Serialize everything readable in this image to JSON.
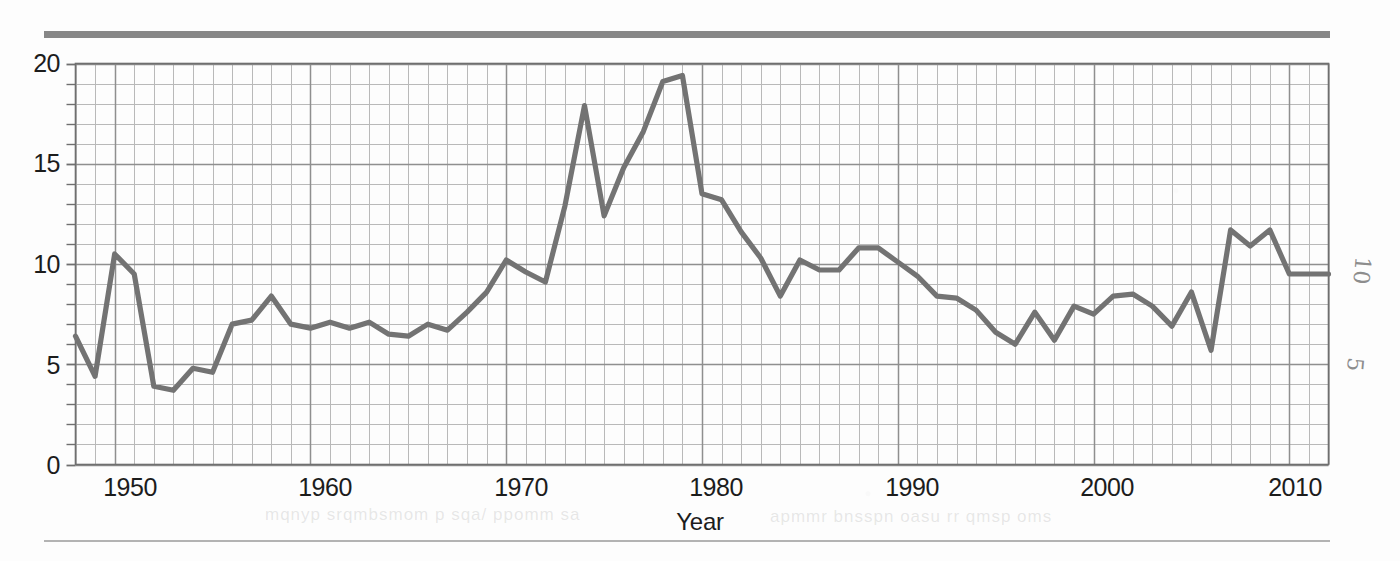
{
  "figure": {
    "axis_x_title": "Year",
    "y_ticks": [
      "0",
      "5",
      "10",
      "15",
      "20"
    ],
    "x_ticks": [
      "1950",
      "1960",
      "1970",
      "1980",
      "1990",
      "2000",
      "2010"
    ],
    "line_color": "#737373",
    "grid_color": "#8f8f8f",
    "grid_minor_color": "#b9b9b9",
    "rule_color": "#878787"
  },
  "annotations": {
    "hand_10": "10",
    "hand_5": "5"
  },
  "chart_data": {
    "type": "line",
    "title": "",
    "subtitle": "",
    "xlabel": "Year",
    "ylabel": "",
    "xlim": [
      1948,
      2012
    ],
    "ylim": [
      0,
      20
    ],
    "grid": true,
    "legend": "none",
    "series": [
      {
        "name": "value",
        "x": [
          1948,
          1949,
          1950,
          1951,
          1952,
          1953,
          1954,
          1955,
          1956,
          1957,
          1958,
          1959,
          1960,
          1961,
          1962,
          1963,
          1964,
          1965,
          1966,
          1967,
          1968,
          1969,
          1970,
          1971,
          1972,
          1973,
          1974,
          1975,
          1976,
          1977,
          1978,
          1979,
          1980,
          1981,
          1982,
          1983,
          1984,
          1985,
          1986,
          1987,
          1988,
          1989,
          1990,
          1991,
          1992,
          1993,
          1994,
          1995,
          1996,
          1997,
          1998,
          1999,
          2000,
          2001,
          2002,
          2003,
          2004,
          2005,
          2006,
          2007,
          2008,
          2009,
          2010,
          2011,
          2012
        ],
        "values": [
          6.4,
          4.4,
          10.5,
          9.5,
          3.9,
          3.7,
          4.8,
          4.6,
          7.0,
          7.2,
          8.4,
          7.0,
          6.8,
          7.1,
          6.8,
          7.1,
          6.5,
          6.4,
          7.0,
          6.7,
          7.6,
          8.6,
          10.2,
          9.6,
          9.1,
          12.9,
          17.9,
          12.4,
          14.8,
          16.6,
          19.1,
          19.4,
          13.5,
          13.2,
          11.6,
          10.3,
          8.4,
          10.2,
          9.7,
          9.7,
          10.8,
          10.8,
          10.1,
          9.4,
          8.4,
          8.3,
          7.7,
          6.6,
          6.0,
          7.6,
          6.2,
          7.9,
          7.5,
          8.4,
          8.5,
          7.9,
          6.9,
          8.6,
          5.7,
          11.7,
          10.9,
          11.7,
          9.5,
          9.5,
          9.5
        ]
      }
    ],
    "y_tick_values": [
      0,
      5,
      10,
      15,
      20
    ],
    "x_tick_values": [
      1950,
      1960,
      1970,
      1980,
      1990,
      2000,
      2010
    ],
    "minor_grid_step_x": 1,
    "minor_grid_step_y": 1
  }
}
